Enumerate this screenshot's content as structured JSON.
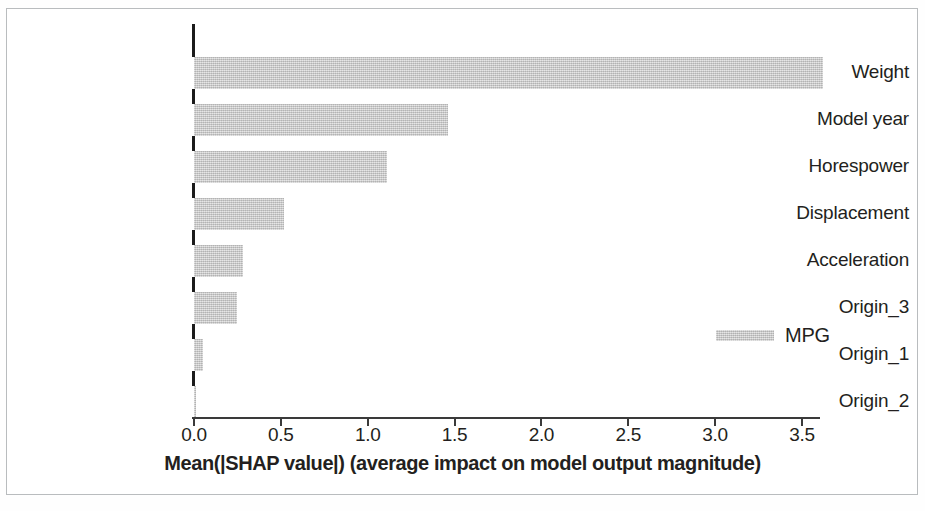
{
  "chart_data": {
    "type": "bar",
    "orientation": "horizontal",
    "title": "",
    "xlabel": "Mean(|SHAP value|) (average impact on model output magnitude)",
    "ylabel": "",
    "categories": [
      "Weight",
      "Model year",
      "Horespower",
      "Displacement",
      "Acceleration",
      "Origin_3",
      "Origin_1",
      "Origin_2"
    ],
    "values": [
      3.62,
      1.46,
      1.11,
      0.52,
      0.28,
      0.25,
      0.05,
      0.01
    ],
    "series": [
      {
        "name": "MPG",
        "values": [
          3.62,
          1.46,
          1.11,
          0.52,
          0.28,
          0.25,
          0.05,
          0.01
        ]
      }
    ],
    "xlim": [
      0.0,
      3.62
    ],
    "ylim": [
      0,
      8
    ],
    "xticks": [
      "0.0",
      "0.5",
      "1.0",
      "1.5",
      "2.0",
      "2.5",
      "3.0",
      "3.5"
    ],
    "xtick_values": [
      0.0,
      0.5,
      1.0,
      1.5,
      2.0,
      2.5,
      3.0,
      3.5
    ],
    "grid": false,
    "legend": {
      "position": "center-right",
      "entries": [
        {
          "label": "MPG",
          "color": "#c9c9c9"
        }
      ]
    },
    "bar_color": "#c9c9c9",
    "axis_color": "#231f20"
  },
  "axis": {
    "x_title": "Mean(|SHAP value|) (average impact on model output magnitude)",
    "ticks": [
      "0.0",
      "0.5",
      "1.0",
      "1.5",
      "2.0",
      "2.5",
      "3.0",
      "3.5"
    ]
  },
  "legend": {
    "label": "MPG"
  },
  "colors": {
    "bar": "#c9c9c9",
    "axis": "#231f20",
    "frame": "#b9bcbe",
    "background": "#ffffff"
  }
}
